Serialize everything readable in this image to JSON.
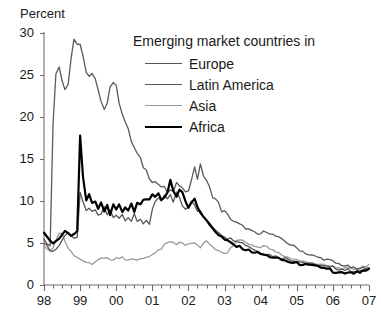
{
  "chart_data": {
    "type": "line",
    "title": "",
    "xlabel": "",
    "ylabel": "Percent",
    "ylim": [
      0,
      30
    ],
    "yticks": [
      0,
      5,
      10,
      15,
      20,
      25,
      30
    ],
    "xlim": [
      1998.0,
      2007.0
    ],
    "xticks": [
      1998,
      1999,
      2000,
      2001,
      2002,
      2003,
      2004,
      2005,
      2006,
      2007
    ],
    "xtick_labels": [
      "98",
      "99",
      "00",
      "01",
      "02",
      "03",
      "04",
      "05",
      "06",
      "07"
    ],
    "grid": false,
    "legend_position": "upper-right-inside",
    "legend_title": "Emerging market countries in",
    "minor_tick_interval_years": 0.25,
    "series": [
      {
        "name": "Europe",
        "color": "#555555",
        "width": 1.3,
        "x": [
          1998.0,
          1998.08,
          1998.17,
          1998.25,
          1998.33,
          1998.42,
          1998.5,
          1998.58,
          1998.67,
          1998.75,
          1998.83,
          1998.92,
          1999.0,
          1999.08,
          1999.17,
          1999.25,
          1999.33,
          1999.42,
          1999.5,
          1999.58,
          1999.67,
          1999.75,
          1999.83,
          1999.92,
          2000.0,
          2000.08,
          2000.17,
          2000.25,
          2000.33,
          2000.42,
          2000.5,
          2000.58,
          2000.67,
          2000.75,
          2000.83,
          2000.92,
          2001.0,
          2001.08,
          2001.17,
          2001.25,
          2001.33,
          2001.42,
          2001.5,
          2001.58,
          2001.67,
          2001.75,
          2001.83,
          2001.92,
          2002.0,
          2002.08,
          2002.17,
          2002.25,
          2002.33,
          2002.42,
          2002.5,
          2002.58,
          2002.67,
          2002.75,
          2002.83,
          2002.92,
          2003.0,
          2003.08,
          2003.17,
          2003.25,
          2003.33,
          2003.42,
          2003.5,
          2003.58,
          2003.67,
          2003.75,
          2003.83,
          2003.92,
          2004.0,
          2004.08,
          2004.17,
          2004.25,
          2004.33,
          2004.42,
          2004.5,
          2004.58,
          2004.67,
          2004.75,
          2004.83,
          2004.92,
          2005.0,
          2005.08,
          2005.17,
          2005.25,
          2005.33,
          2005.42,
          2005.5,
          2005.58,
          2005.67,
          2005.75,
          2005.83,
          2005.92,
          2006.0,
          2006.08,
          2006.17,
          2006.25,
          2006.33,
          2006.42,
          2006.5,
          2006.58,
          2006.67,
          2006.75,
          2006.83,
          2006.92,
          2007.0
        ],
        "y": [
          5.1,
          4.6,
          4.2,
          4.0,
          4.3,
          4.7,
          5.3,
          6.0,
          6.3,
          5.9,
          5.4,
          5.6,
          11.3,
          9.5,
          8.6,
          9.2,
          8.4,
          9.0,
          8.2,
          8.6,
          9.1,
          8.3,
          8.8,
          8.1,
          8.6,
          8.0,
          8.4,
          7.8,
          8.3,
          7.6,
          8.1,
          7.5,
          7.9,
          7.3,
          7.8,
          7.2,
          8.6,
          9.6,
          10.4,
          9.8,
          10.6,
          9.9,
          10.8,
          10.1,
          10.9,
          10.2,
          9.6,
          9.0,
          9.6,
          10.3,
          9.7,
          9.1,
          8.6,
          8.1,
          7.7,
          7.3,
          6.9,
          6.6,
          6.3,
          6.0,
          5.8,
          5.6,
          5.5,
          5.4,
          5.3,
          5.2,
          5.0,
          4.8,
          4.6,
          4.4,
          4.2,
          4.0,
          3.9,
          3.8,
          3.7,
          3.6,
          3.5,
          3.4,
          3.3,
          3.2,
          3.2,
          3.1,
          3.0,
          2.9,
          2.9,
          2.8,
          2.7,
          2.6,
          2.6,
          2.5,
          2.4,
          2.4,
          2.3,
          2.2,
          2.2,
          2.1,
          2.1,
          2.0,
          1.9,
          1.9,
          1.8,
          1.8,
          1.7,
          1.7,
          1.6,
          1.6,
          1.7,
          1.8,
          1.9
        ]
      },
      {
        "name": "Latin America",
        "color": "#5a5a5a",
        "width": 1.3,
        "x": [
          1998.0,
          1998.08,
          1998.17,
          1998.25,
          1998.33,
          1998.42,
          1998.5,
          1998.58,
          1998.67,
          1998.75,
          1998.83,
          1998.92,
          1999.0,
          1999.08,
          1999.17,
          1999.25,
          1999.33,
          1999.42,
          1999.5,
          1999.58,
          1999.67,
          1999.75,
          1999.83,
          1999.92,
          2000.0,
          2000.08,
          2000.17,
          2000.25,
          2000.33,
          2000.42,
          2000.5,
          2000.58,
          2000.67,
          2000.75,
          2000.83,
          2000.92,
          2001.0,
          2001.08,
          2001.17,
          2001.25,
          2001.33,
          2001.42,
          2001.5,
          2001.58,
          2001.67,
          2001.75,
          2001.83,
          2001.92,
          2002.0,
          2002.08,
          2002.17,
          2002.25,
          2002.33,
          2002.42,
          2002.5,
          2002.58,
          2002.67,
          2002.75,
          2002.83,
          2002.92,
          2003.0,
          2003.08,
          2003.17,
          2003.25,
          2003.33,
          2003.42,
          2003.5,
          2003.58,
          2003.67,
          2003.75,
          2003.83,
          2003.92,
          2004.0,
          2004.08,
          2004.17,
          2004.25,
          2004.33,
          2004.42,
          2004.5,
          2004.58,
          2004.67,
          2004.75,
          2004.83,
          2004.92,
          2005.0,
          2005.08,
          2005.17,
          2005.25,
          2005.33,
          2005.42,
          2005.5,
          2005.58,
          2005.67,
          2005.75,
          2005.83,
          2005.92,
          2006.0,
          2006.08,
          2006.17,
          2006.25,
          2006.33,
          2006.42,
          2006.5,
          2006.58,
          2006.67,
          2006.75,
          2006.83,
          2006.92,
          2007.0
        ],
        "y": [
          5.4,
          5.0,
          4.8,
          19.0,
          25.2,
          26.3,
          24.5,
          23.6,
          24.0,
          27.0,
          29.4,
          28.7,
          28.3,
          27.0,
          25.6,
          24.8,
          25.0,
          24.3,
          23.0,
          21.5,
          21.2,
          22.0,
          23.6,
          24.3,
          23.4,
          22.0,
          20.6,
          19.4,
          18.3,
          17.2,
          16.3,
          15.5,
          14.8,
          14.2,
          13.6,
          13.0,
          12.6,
          12.3,
          12.0,
          11.7,
          11.4,
          11.1,
          10.9,
          11.3,
          12.0,
          11.4,
          11.9,
          11.5,
          11.0,
          12.6,
          14.3,
          12.2,
          14.6,
          13.0,
          12.2,
          11.5,
          10.8,
          10.2,
          9.6,
          9.0,
          8.6,
          8.2,
          7.9,
          7.6,
          7.4,
          7.2,
          7.0,
          6.8,
          6.6,
          6.4,
          6.2,
          6.0,
          6.1,
          6.3,
          6.4,
          6.2,
          6.0,
          5.8,
          5.6,
          5.4,
          5.2,
          5.0,
          4.8,
          4.6,
          4.4,
          4.2,
          4.0,
          3.8,
          3.6,
          3.5,
          3.4,
          3.3,
          3.2,
          3.1,
          3.0,
          2.9,
          2.8,
          2.6,
          2.5,
          2.4,
          2.3,
          2.2,
          2.1,
          2.0,
          1.9,
          1.9,
          2.0,
          2.1,
          2.2
        ]
      },
      {
        "name": "Asia",
        "color": "#999999",
        "width": 1.3,
        "x": [
          1998.0,
          1998.08,
          1998.17,
          1998.25,
          1998.33,
          1998.42,
          1998.5,
          1998.58,
          1998.67,
          1998.75,
          1998.83,
          1998.92,
          1999.0,
          1999.08,
          1999.17,
          1999.25,
          1999.33,
          1999.42,
          1999.5,
          1999.58,
          1999.67,
          1999.75,
          1999.83,
          1999.92,
          2000.0,
          2000.08,
          2000.17,
          2000.25,
          2000.33,
          2000.42,
          2000.5,
          2000.58,
          2000.67,
          2000.75,
          2000.83,
          2000.92,
          2001.0,
          2001.08,
          2001.17,
          2001.25,
          2001.33,
          2001.42,
          2001.5,
          2001.58,
          2001.67,
          2001.75,
          2001.83,
          2001.92,
          2002.0,
          2002.08,
          2002.17,
          2002.25,
          2002.33,
          2002.42,
          2002.5,
          2002.58,
          2002.67,
          2002.75,
          2002.83,
          2002.92,
          2003.0,
          2003.08,
          2003.17,
          2003.25,
          2003.33,
          2003.42,
          2003.5,
          2003.58,
          2003.67,
          2003.75,
          2003.83,
          2003.92,
          2004.0,
          2004.08,
          2004.17,
          2004.25,
          2004.33,
          2004.42,
          2004.5,
          2004.58,
          2004.67,
          2004.75,
          2004.83,
          2004.92,
          2005.0,
          2005.08,
          2005.17,
          2005.25,
          2005.33,
          2005.42,
          2005.5,
          2005.58,
          2005.67,
          2005.75,
          2005.83,
          2005.92,
          2006.0,
          2006.08,
          2006.17,
          2006.25,
          2006.33,
          2006.42,
          2006.5,
          2006.58,
          2006.67,
          2006.75,
          2006.83,
          2006.92,
          2007.0
        ],
        "y": [
          4.6,
          4.2,
          3.9,
          4.4,
          5.4,
          6.2,
          6.0,
          5.2,
          4.5,
          4.0,
          3.6,
          3.3,
          3.0,
          2.8,
          2.7,
          2.6,
          2.6,
          2.7,
          2.9,
          3.1,
          3.2,
          3.2,
          3.1,
          3.0,
          3.1,
          3.2,
          3.2,
          3.0,
          2.9,
          3.0,
          3.2,
          3.1,
          3.0,
          3.1,
          3.3,
          3.5,
          3.6,
          3.9,
          4.2,
          4.4,
          4.7,
          5.0,
          5.2,
          5.0,
          4.9,
          5.1,
          5.0,
          4.8,
          4.9,
          5.0,
          4.9,
          4.7,
          4.5,
          4.9,
          5.1,
          4.9,
          4.6,
          4.3,
          4.0,
          3.8,
          3.7,
          3.9,
          4.3,
          4.8,
          5.2,
          5.4,
          5.3,
          5.1,
          4.9,
          4.7,
          4.6,
          4.5,
          4.6,
          4.7,
          4.5,
          4.3,
          4.1,
          3.9,
          3.8,
          3.6,
          3.4,
          3.3,
          3.2,
          3.1,
          3.0,
          2.9,
          2.8,
          2.7,
          2.7,
          2.6,
          2.5,
          2.5,
          2.4,
          2.3,
          2.3,
          2.2,
          2.2,
          2.1,
          2.0,
          2.0,
          1.9,
          1.9,
          1.9,
          1.9,
          2.0,
          2.1,
          2.2,
          2.3,
          2.4
        ]
      },
      {
        "name": "Africa",
        "color": "#000000",
        "width": 2.2,
        "x": [
          1998.0,
          1998.08,
          1998.17,
          1998.25,
          1998.33,
          1998.42,
          1998.5,
          1998.58,
          1998.67,
          1998.75,
          1998.83,
          1998.92,
          1999.0,
          1999.08,
          1999.17,
          1999.25,
          1999.33,
          1999.42,
          1999.5,
          1999.58,
          1999.67,
          1999.75,
          1999.83,
          1999.92,
          2000.0,
          2000.08,
          2000.17,
          2000.25,
          2000.33,
          2000.42,
          2000.5,
          2000.58,
          2000.67,
          2000.75,
          2000.83,
          2000.92,
          2001.0,
          2001.08,
          2001.17,
          2001.25,
          2001.33,
          2001.42,
          2001.5,
          2001.58,
          2001.67,
          2001.75,
          2001.83,
          2001.92,
          2002.0,
          2002.08,
          2002.17,
          2002.25,
          2002.33,
          2002.42,
          2002.5,
          2002.58,
          2002.67,
          2002.75,
          2002.83,
          2002.92,
          2003.0,
          2003.08,
          2003.17,
          2003.25,
          2003.33,
          2003.42,
          2003.5,
          2003.58,
          2003.67,
          2003.75,
          2003.83,
          2003.92,
          2004.0,
          2004.08,
          2004.17,
          2004.25,
          2004.33,
          2004.42,
          2004.5,
          2004.58,
          2004.67,
          2004.75,
          2004.83,
          2004.92,
          2005.0,
          2005.08,
          2005.17,
          2005.25,
          2005.33,
          2005.42,
          2005.5,
          2005.58,
          2005.67,
          2005.75,
          2005.83,
          2005.92,
          2006.0,
          2006.08,
          2006.17,
          2006.25,
          2006.33,
          2006.42,
          2006.5,
          2006.58,
          2006.67,
          2006.75,
          2006.83,
          2006.92,
          2007.0
        ],
        "y": [
          6.2,
          5.7,
          5.3,
          5.0,
          5.2,
          5.6,
          6.0,
          6.4,
          6.2,
          5.8,
          6.0,
          6.4,
          18.1,
          13.0,
          10.2,
          10.6,
          9.4,
          9.9,
          9.0,
          9.6,
          8.9,
          9.4,
          8.7,
          9.2,
          8.6,
          9.3,
          8.8,
          9.5,
          9.0,
          9.6,
          9.1,
          9.7,
          9.2,
          9.8,
          10.2,
          10.6,
          11.0,
          10.4,
          10.8,
          10.2,
          10.6,
          11.0,
          12.7,
          11.2,
          10.5,
          11.4,
          10.8,
          10.0,
          9.4,
          9.9,
          10.6,
          9.4,
          8.8,
          8.2,
          7.6,
          7.2,
          6.8,
          6.4,
          6.0,
          5.7,
          5.4,
          5.2,
          5.0,
          4.8,
          4.6,
          4.5,
          4.4,
          4.2,
          4.1,
          4.0,
          3.9,
          3.8,
          3.7,
          3.6,
          3.5,
          3.4,
          3.3,
          3.2,
          3.1,
          3.0,
          2.9,
          2.8,
          2.7,
          2.6,
          2.6,
          2.5,
          2.5,
          2.4,
          2.3,
          2.3,
          2.2,
          2.2,
          2.1,
          2.0,
          2.0,
          1.9,
          1.4,
          1.4,
          1.4,
          1.4,
          1.4,
          1.4,
          1.4,
          1.4,
          1.5,
          1.5,
          1.6,
          1.7,
          1.8
        ]
      }
    ]
  },
  "axis": {
    "y_label": "Percent",
    "y_tick_labels": [
      "30",
      "25",
      "20",
      "15",
      "10",
      "5",
      "0"
    ],
    "x_tick_labels": [
      "98",
      "99",
      "00",
      "01",
      "02",
      "03",
      "04",
      "05",
      "06",
      "07"
    ]
  },
  "legend": {
    "title": "Emerging market countries in",
    "items": [
      {
        "label": "Europe",
        "color": "#555555",
        "width": 1.6
      },
      {
        "label": "Latin America",
        "color": "#5a5a5a",
        "width": 1.6
      },
      {
        "label": "Asia",
        "color": "#999999",
        "width": 1.6
      },
      {
        "label": "Africa",
        "color": "#000000",
        "width": 2.6
      }
    ]
  },
  "caption": {
    "text": ""
  }
}
